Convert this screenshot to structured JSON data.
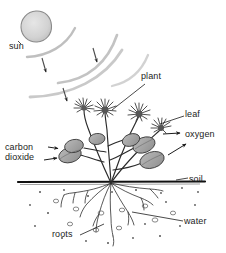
{
  "diagram": {
    "labels": {
      "sun": "sun",
      "plant": "plant",
      "leaf": "leaf",
      "oxygen": "oxygen",
      "carbon": "carbon",
      "dioxide": "dioxide",
      "soil": "soil",
      "water": "water",
      "roots": "roots"
    },
    "colors": {
      "ink": "#1c1c1c",
      "sun_fill": "#d8d8d8",
      "leaf_fill": "#a9a9a9",
      "flower_fill": "#6e6e6e",
      "ray": "#bdbdbd",
      "soil_line": "#111111",
      "background": "#ffffff"
    },
    "elements": {
      "sun_rays_count": 4,
      "flower_heads": 4,
      "leaves": 6,
      "soil_line_y": 182
    }
  }
}
